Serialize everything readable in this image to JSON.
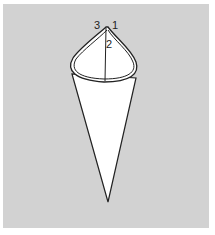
{
  "figure": {
    "background_color": "#d2d2d2",
    "cone_color": "#ffffff",
    "line_color": "#222222",
    "labels": [
      {
        "id": "3",
        "text": "3",
        "x": 94,
        "y": 20
      },
      {
        "id": "1",
        "text": "1",
        "x": 112,
        "y": 20
      },
      {
        "id": "2",
        "text": "2",
        "x": 106,
        "y": 39
      }
    ]
  }
}
